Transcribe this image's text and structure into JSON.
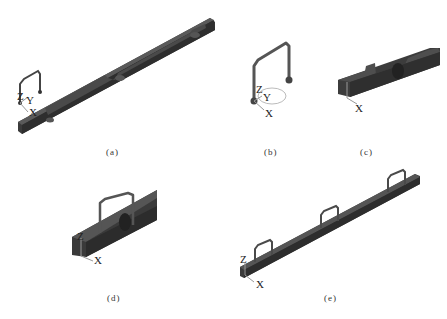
{
  "figure": {
    "panels": [
      {
        "id": "a",
        "caption": "(a)",
        "axes": [
          "Z",
          "Y",
          "X"
        ],
        "content": "long channel beam with notches and U-bracket with coordinate axes"
      },
      {
        "id": "b",
        "caption": "(b)",
        "axes": [
          "Z",
          "Y",
          "X"
        ],
        "content": "U-shaped bracket with rotation ellipse"
      },
      {
        "id": "c",
        "caption": "(c)",
        "axes": [
          "X"
        ],
        "content": "close-up of channel beam end with notch"
      },
      {
        "id": "d",
        "caption": "(d)",
        "axes": [
          "Z",
          "X"
        ],
        "content": "channel beam end with U-bracket inserted"
      },
      {
        "id": "e",
        "caption": "(e)",
        "axes": [
          "Z",
          "X"
        ],
        "content": "long channel beam with three U-brackets"
      }
    ],
    "colors": {
      "beam_dark": "#3a3a3a",
      "beam_mid": "#555555",
      "beam_light": "#707070",
      "axis_gray": "#999999",
      "ellipse": "#aaaaaa",
      "background": "#ffffff"
    }
  }
}
